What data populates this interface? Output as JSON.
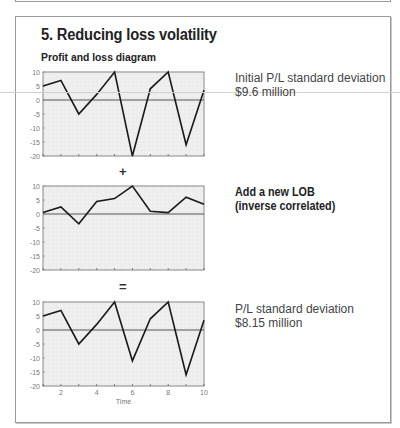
{
  "header": {
    "title": "5. Reducing loss volatility",
    "subtitle": "Profit and loss diagram"
  },
  "operators": {
    "plus": "+",
    "equals": "="
  },
  "notes": {
    "initial_line1": "Initial P/L standard deviation",
    "initial_line2": "$9.6 million",
    "lob_line1": "Add a new LOB",
    "lob_line2": "(inverse correlated)",
    "result_line1": "P/L standard deviation",
    "result_line2": "$8.15 million"
  },
  "colors": {
    "plot_bg": "#ececec",
    "grid": "#f6f6f6",
    "line": "#1a1a1a",
    "zero_line": "#555555",
    "frame": "#888888"
  },
  "chart_data": [
    {
      "type": "line",
      "title": "Initial P/L",
      "x": [
        1,
        2,
        3,
        4,
        5,
        6,
        7,
        8,
        9,
        10
      ],
      "values": [
        5,
        7,
        -5,
        2,
        10,
        -20,
        4,
        10,
        -16,
        3.5
      ],
      "ylim": [
        -20,
        10
      ],
      "xlim": [
        1,
        10
      ],
      "yticks": [
        10,
        5,
        0,
        -5,
        -10,
        -15,
        -20
      ],
      "xticks": [],
      "xlabel": "",
      "ylabel": "",
      "grid": true,
      "annotation": "Initial P/L standard deviation $9.6 million"
    },
    {
      "type": "line",
      "title": "New LOB (inverse correlated)",
      "x": [
        1,
        2,
        3,
        4,
        5,
        6,
        7,
        8,
        9,
        10
      ],
      "values": [
        0.5,
        2.5,
        -3.5,
        4.5,
        5.5,
        10,
        1,
        0.5,
        6,
        3.5
      ],
      "ylim": [
        -20,
        10
      ],
      "xlim": [
        1,
        10
      ],
      "yticks": [
        10,
        5,
        0,
        -5,
        -10,
        -15,
        -20
      ],
      "xticks": [],
      "xlabel": "",
      "ylabel": "",
      "grid": true,
      "annotation": "Add a new LOB (inverse correlated)"
    },
    {
      "type": "line",
      "title": "Combined P/L",
      "x": [
        1,
        2,
        3,
        4,
        5,
        6,
        7,
        8,
        9,
        10
      ],
      "values": [
        5,
        7,
        -5,
        2,
        10,
        -11,
        4,
        10,
        -16,
        3.5
      ],
      "ylim": [
        -20,
        10
      ],
      "xlim": [
        1,
        10
      ],
      "yticks": [
        10,
        5,
        0,
        -5,
        -10,
        -15,
        -20
      ],
      "xticks": [
        2,
        4,
        6,
        8,
        10
      ],
      "xlabel": "Time",
      "ylabel": "",
      "grid": true,
      "annotation": "P/L standard deviation $8.15 million"
    }
  ]
}
